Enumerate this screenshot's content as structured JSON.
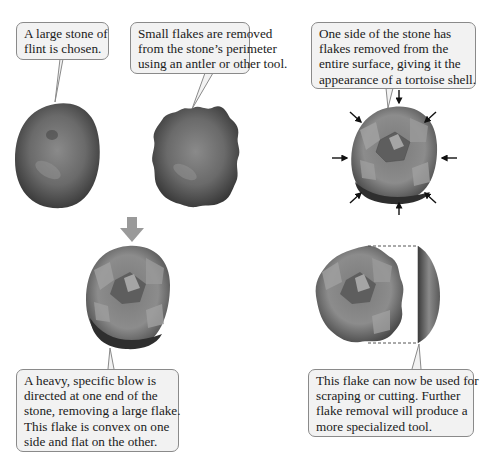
{
  "diagram": {
    "steps": [
      {
        "id": "step-1",
        "caption_lines": [
          "A large stone of",
          "flint is chosen."
        ],
        "illustration": "rounded-flint-stone"
      },
      {
        "id": "step-2",
        "caption_lines": [
          "Small flakes are removed",
          "from the stone’s perimeter",
          "using an antler or other tool."
        ],
        "illustration": "stone-with-scalloped-edge"
      },
      {
        "id": "step-3",
        "caption_lines": [
          "One side of the stone has",
          "flakes removed from the",
          "entire surface, giving it the",
          "appearance of a tortoise shell."
        ],
        "illustration": "tortoise-shell-core-with-inward-arrows",
        "arrow_count": 8
      },
      {
        "id": "step-4",
        "caption_lines": [
          "A heavy, specific blow is",
          "directed at one end of the",
          "stone, removing a large flake.",
          "This flake is convex on one",
          "side and flat on the other."
        ],
        "illustration": "core-with-downward-blow-arrow"
      },
      {
        "id": "step-5",
        "caption_lines": [
          "This flake can now be used for",
          "scraping or cutting. Further",
          "flake removal will produce a",
          "more specialized tool."
        ],
        "illustration": "detached-flake-with-dashed-outline"
      }
    ],
    "colors": {
      "callout_fill": "#f2f2f2",
      "callout_border": "#8a8a8a",
      "stone_dark": "#3a3a3a",
      "stone_mid": "#6e6e6e",
      "stone_light": "#a8a8a8",
      "blow_arrow": "#9a9a9a",
      "force_arrow": "#111111"
    }
  }
}
